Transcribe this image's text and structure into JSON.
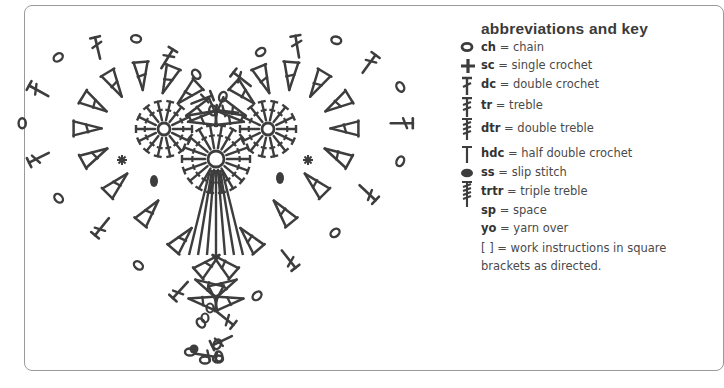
{
  "key": {
    "title": "abbreviations and key",
    "items": [
      {
        "icon": "chain-icon",
        "abbr": "ch",
        "meaning": "= chain"
      },
      {
        "icon": "single-crochet-icon",
        "abbr": "sc",
        "meaning": "= single crochet"
      },
      {
        "icon": "double-crochet-icon",
        "abbr": "dc",
        "meaning": "= double crochet"
      },
      {
        "icon": "treble-icon",
        "abbr": "tr",
        "meaning": "= treble"
      },
      {
        "icon": "double-treble-icon",
        "abbr": "dtr",
        "meaning": "= double treble"
      },
      {
        "icon": "half-double-crochet-icon",
        "abbr": "hdc",
        "meaning": "= half double crochet"
      },
      {
        "icon": "slip-stitch-icon",
        "abbr": "ss",
        "meaning": "= slip stitch"
      },
      {
        "icon": "triple-treble-icon",
        "abbr": "trtr",
        "meaning": "= triple treble"
      },
      {
        "icon": "",
        "abbr": "sp",
        "meaning": "= space"
      },
      {
        "icon": "",
        "abbr": "yo",
        "meaning": "= yarn over"
      },
      {
        "icon": "",
        "abbr": "[ ]",
        "meaning": "= work instructions in square"
      },
      {
        "icon": "",
        "abbr": "",
        "meaning": "brackets as directed."
      }
    ]
  },
  "diagram": {
    "ink_color": "#3d3d3d",
    "frame_color": "#9a9a9a"
  }
}
